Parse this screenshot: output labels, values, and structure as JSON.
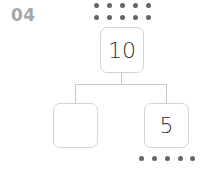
{
  "problem_number": "04",
  "top_box": {
    "value": "10",
    "dots": 10
  },
  "left_box": {
    "value": ""
  },
  "right_box": {
    "value": "5",
    "dots": 5
  },
  "colors": {
    "dot": "#666666",
    "border": "#d4d4d4",
    "label": "#a7a7a7"
  }
}
